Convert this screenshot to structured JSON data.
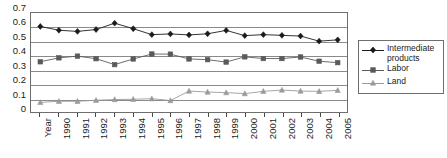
{
  "chart_data": {
    "type": "line",
    "title": "",
    "subtitle": "",
    "xlabel": "",
    "ylabel": "",
    "grid": true,
    "legend_position": "right",
    "ylim": [
      0,
      0.7
    ],
    "ytick_labels": [
      "0.7",
      "0.6",
      "0.5",
      "0.4",
      "0.3",
      "0.2",
      "0.1",
      "0"
    ],
    "ytick_values": [
      0.7,
      0.6,
      0.5,
      0.4,
      0.3,
      0.2,
      0.1,
      0
    ],
    "categories": [
      "Year",
      "1990",
      "1991",
      "1992",
      "1993",
      "1994",
      "1995",
      "1996",
      "1997",
      "1998",
      "1999",
      "2000",
      "2001",
      "2002",
      "2003",
      "2004",
      "2005"
    ],
    "series": [
      {
        "name": "Intermediate products",
        "marker": "diamond",
        "color": "#1a1a1a",
        "values": [
          0.605,
          0.578,
          0.57,
          0.583,
          0.628,
          0.589,
          0.547,
          0.552,
          0.545,
          0.553,
          0.577,
          0.54,
          0.547,
          0.542,
          0.537,
          0.501,
          0.51
        ]
      },
      {
        "name": "Labor",
        "marker": "square",
        "color": "#5a5a5a",
        "values": [
          0.355,
          0.383,
          0.395,
          0.377,
          0.335,
          0.375,
          0.41,
          0.409,
          0.375,
          0.37,
          0.353,
          0.39,
          0.378,
          0.378,
          0.389,
          0.359,
          0.349
        ]
      },
      {
        "name": "Land",
        "marker": "triangle",
        "color": "#9a9a9a",
        "values": [
          0.068,
          0.076,
          0.076,
          0.083,
          0.088,
          0.09,
          0.094,
          0.081,
          0.148,
          0.141,
          0.137,
          0.13,
          0.146,
          0.155,
          0.148,
          0.146,
          0.153
        ]
      }
    ]
  },
  "legend": {
    "items": [
      {
        "label": "Intermediate products"
      },
      {
        "label": "Labor"
      },
      {
        "label": "Land"
      }
    ]
  }
}
